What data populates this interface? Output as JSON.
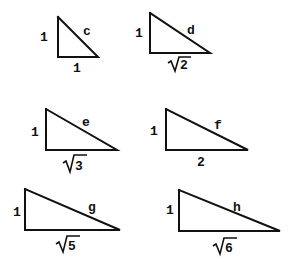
{
  "diagram": {
    "title": "",
    "triangles": [
      {
        "id": "c",
        "leg_vertical": "1",
        "leg_horizontal": "1",
        "hypotenuse": "c",
        "base_is_radical": false,
        "base_radicand": ""
      },
      {
        "id": "d",
        "leg_vertical": "1",
        "leg_horizontal": "√2",
        "hypotenuse": "d",
        "base_is_radical": true,
        "base_radicand": "2"
      },
      {
        "id": "e",
        "leg_vertical": "1",
        "leg_horizontal": "√3",
        "hypotenuse": "e",
        "base_is_radical": true,
        "base_radicand": "3"
      },
      {
        "id": "f",
        "leg_vertical": "1",
        "leg_horizontal": "2",
        "hypotenuse": "f",
        "base_is_radical": false,
        "base_radicand": ""
      },
      {
        "id": "g",
        "leg_vertical": "1",
        "leg_horizontal": "√5",
        "hypotenuse": "g",
        "base_is_radical": true,
        "base_radicand": "5"
      },
      {
        "id": "h",
        "leg_vertical": "1",
        "leg_horizontal": "√6",
        "hypotenuse": "h",
        "base_is_radical": true,
        "base_radicand": "6"
      }
    ]
  }
}
